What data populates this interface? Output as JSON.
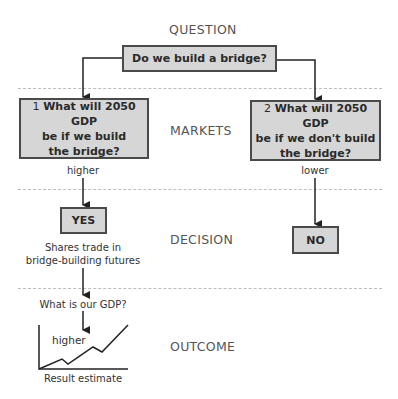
{
  "sections": {
    "question": "QUESTION",
    "markets": "MARKETS",
    "decision": "DECISION",
    "outcome": "OUTCOME"
  },
  "question_box": {
    "text": "Do we build a bridge?"
  },
  "markets": {
    "left_box": {
      "number": "1",
      "line1": "What will 2050 GDP",
      "line2": "be if we build",
      "line3": "the bridge?"
    },
    "right_box": {
      "number": "2",
      "line1": "What will 2050 GDP",
      "line2": "be if we don't build",
      "line3": "the bridge?"
    },
    "left_result": "higher",
    "right_result": "lower"
  },
  "decision": {
    "yes_label": "YES",
    "no_label": "NO",
    "yes_caption_line1": "Shares trade in",
    "yes_caption_line2": "bridge-building futures"
  },
  "outcome": {
    "question": "What is our GDP?",
    "chart_label": "higher",
    "chart_caption": "Result estimate"
  },
  "colors": {
    "box_fill": "#d6d6d6",
    "box_border": "#4a4a4a",
    "dash_line": "#bdbdbd",
    "arrow": "#222222"
  }
}
